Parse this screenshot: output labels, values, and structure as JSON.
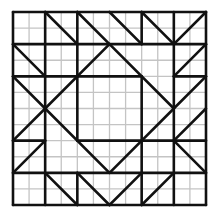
{
  "diagram": {
    "grid": {
      "fine_divisions": 12,
      "coarse_divisions": 6,
      "origin_px": [
        13,
        12
      ],
      "size_px": 193
    },
    "colors": {
      "fine_grid": "#c4c4c4",
      "bold_line": "#111111",
      "background": "#ffffff"
    },
    "bold_segments_coarse": [
      [
        0,
        0,
        6,
        0
      ],
      [
        6,
        0,
        6,
        6
      ],
      [
        6,
        6,
        0,
        6
      ],
      [
        0,
        6,
        0,
        0
      ],
      [
        0,
        1,
        6,
        1
      ],
      [
        0,
        5,
        6,
        5
      ],
      [
        1,
        0,
        1,
        6
      ],
      [
        5,
        0,
        5,
        6
      ],
      [
        2,
        2,
        4,
        2
      ],
      [
        4,
        2,
        4,
        4
      ],
      [
        4,
        4,
        2,
        4
      ],
      [
        2,
        4,
        2,
        2
      ],
      [
        3,
        1,
        5,
        3
      ],
      [
        5,
        3,
        3,
        5
      ],
      [
        3,
        5,
        1,
        3
      ],
      [
        1,
        3,
        3,
        1
      ],
      [
        1,
        0,
        2,
        1
      ],
      [
        2,
        0,
        3,
        1
      ],
      [
        4,
        1,
        3,
        0
      ],
      [
        5,
        1,
        4,
        0
      ],
      [
        5,
        1,
        6,
        0
      ],
      [
        5,
        2,
        6,
        1
      ],
      [
        5,
        3,
        6,
        2
      ],
      [
        5,
        4,
        6,
        3
      ],
      [
        5,
        4,
        6,
        5
      ],
      [
        4,
        6,
        5,
        5
      ],
      [
        3,
        6,
        4,
        5
      ],
      [
        2,
        5,
        3,
        6
      ],
      [
        1,
        5,
        2,
        6
      ],
      [
        0,
        5,
        1,
        4
      ],
      [
        0,
        4,
        1,
        3
      ],
      [
        0,
        1,
        1,
        2
      ],
      [
        0,
        2,
        1,
        3
      ],
      [
        0,
        2,
        1,
        2
      ],
      [
        0,
        4,
        1,
        4
      ],
      [
        5,
        2,
        6,
        2
      ],
      [
        5,
        4,
        6,
        4
      ],
      [
        2,
        5,
        2,
        6
      ],
      [
        4,
        5,
        4,
        6
      ],
      [
        2,
        0,
        2,
        1
      ],
      [
        4,
        0,
        4,
        1
      ],
      [
        2,
        1,
        2,
        2
      ],
      [
        4,
        4,
        4,
        5
      ],
      [
        1,
        2,
        2,
        2
      ],
      [
        4,
        4,
        5,
        4
      ]
    ]
  }
}
